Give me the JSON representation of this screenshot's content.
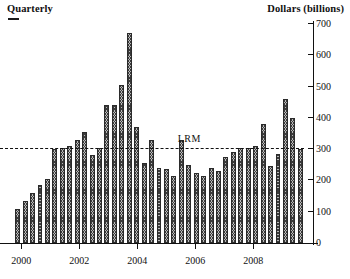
{
  "header": {
    "left_title": "Quarterly",
    "right_title": "Dollars (billions)"
  },
  "annotations": {
    "lrm_label": "LRM",
    "lrm_value": 300
  },
  "colors": {
    "bar_fill": "#b9b9b9",
    "bar_hatch": "#3a3a3a",
    "bar_border": "#2b2b2b",
    "axis": "#111111",
    "reference_line": "#101010"
  },
  "chart_data": {
    "type": "bar",
    "title": "Quarterly",
    "xlabel": "",
    "ylabel": "Dollars (billions)",
    "ylim": [
      0,
      700
    ],
    "yticks": [
      0,
      100,
      200,
      300,
      400,
      500,
      600,
      700
    ],
    "ytick_labels": [
      "0",
      "100",
      "200",
      "300",
      "400",
      "500",
      "600",
      "700"
    ],
    "xticks": [
      2000,
      2002,
      2004,
      2006,
      2008
    ],
    "xtick_labels": [
      "2000",
      "2002",
      "2004",
      "2006",
      "2008"
    ],
    "xlim": [
      1999.75,
      2009.75
    ],
    "grid": false,
    "legend": null,
    "reference_lines": [
      {
        "label": "LRM",
        "value": 300,
        "style": "dashed",
        "orientation": "horizontal"
      }
    ],
    "categories": [
      "2000Q1",
      "2000Q2",
      "2000Q3",
      "2000Q4",
      "2001Q1",
      "2001Q2",
      "2001Q3",
      "2001Q4",
      "2002Q1",
      "2002Q2",
      "2002Q3",
      "2002Q4",
      "2003Q1",
      "2003Q2",
      "2003Q3",
      "2003Q4",
      "2004Q1",
      "2004Q2",
      "2004Q3",
      "2004Q4",
      "2005Q1",
      "2005Q2",
      "2005Q3",
      "2005Q4",
      "2006Q1",
      "2006Q2",
      "2006Q3",
      "2006Q4",
      "2007Q1",
      "2007Q2",
      "2007Q3",
      "2007Q4",
      "2008Q1",
      "2008Q2",
      "2008Q3",
      "2008Q4",
      "2009Q1",
      "2009Q2",
      "2009Q3"
    ],
    "values": [
      110,
      135,
      160,
      185,
      205,
      300,
      305,
      310,
      330,
      355,
      280,
      305,
      440,
      440,
      505,
      670,
      370,
      255,
      330,
      240,
      235,
      215,
      330,
      250,
      225,
      215,
      240,
      230,
      275,
      290,
      305,
      305,
      310,
      380,
      245,
      285,
      460,
      400,
      300
    ]
  }
}
